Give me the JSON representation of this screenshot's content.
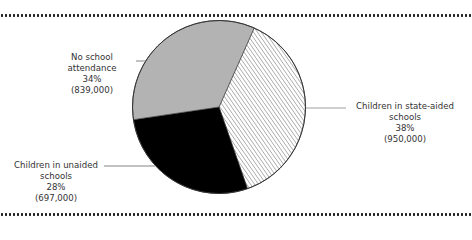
{
  "chart_data": {
    "type": "pie",
    "title": "",
    "slices": [
      {
        "label": "Children in state-aided schools",
        "percent": 38,
        "count": 950000,
        "count_label": "(950,000)",
        "fill": "hatched"
      },
      {
        "label": "Children in unaided schools",
        "percent": 28,
        "count": 697000,
        "count_label": "(697,000)",
        "fill": "#000000"
      },
      {
        "label": "No school attendance",
        "percent": 34,
        "count": 839000,
        "count_label": "(839,000)",
        "fill": "#b3b3b3"
      }
    ],
    "start_angle_deg": 24,
    "direction": "clockwise"
  },
  "labels": {
    "none": {
      "line1": "No school attendance",
      "pct": "34%",
      "count": "(839,000)"
    },
    "unaided": {
      "line1": "Children in unaided",
      "line2": "schools",
      "pct": "28%",
      "count": "(697,000)"
    },
    "state": {
      "line1": "Children in state-aided",
      "line2": "schools",
      "pct": "38%",
      "count": "(950,000)"
    }
  },
  "colors": {
    "gray": "#b3b3b3",
    "black": "#000000",
    "hatch": "#555555",
    "outline": "#333333"
  }
}
